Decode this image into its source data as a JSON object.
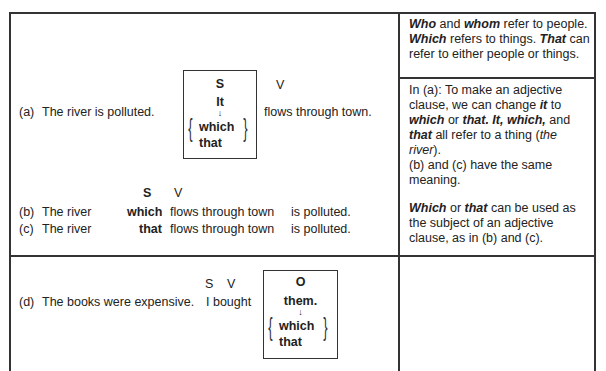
{
  "rows": [
    {
      "label": "(a)",
      "sentence": "The river is polluted.",
      "box": {
        "role": "S",
        "word": "It",
        "alt1": "which",
        "alt2": "that"
      },
      "verb_marker": "V",
      "rest": "flows through town."
    },
    {
      "markers": {
        "s": "S",
        "v": "V"
      },
      "b": {
        "label": "(b)",
        "head": "The river",
        "rel": "which",
        "clause": "flows through town",
        "end": "is polluted."
      },
      "c": {
        "label": "(c)",
        "head": "The river",
        "rel": "that",
        "clause": "flows through town",
        "end": "is polluted."
      }
    },
    {
      "label": "(d)",
      "sentence": "The books were expensive.",
      "markers": {
        "s": "S",
        "v": "V"
      },
      "subject_verb": "I bought",
      "box": {
        "role": "O",
        "word": "them.",
        "alt1": "which",
        "alt2": "that"
      }
    }
  ],
  "notes": {
    "n1": {
      "who": "Who",
      "and": " and ",
      "whom": "whom",
      "t1": " refer to people. ",
      "which": "Which",
      "t2": " refers to things. ",
      "that": "That",
      "t3": " can refer to either people or things."
    },
    "n2": {
      "t1": "In (a): To make an adjective clause, we can change ",
      "it": "it",
      "t2": " to ",
      "which": "which",
      "or": " or ",
      "that_it_which": "that. It, which,",
      "and": " and ",
      "that": "that",
      "t3": " all refer to a thing (",
      "the_river": "the river",
      "t4": ").",
      "t5": "(b) and (c) have the same meaning."
    },
    "n3": {
      "which": "Which",
      "or": " or ",
      "that": "that",
      "t1": " can be used as the subject of an adjective clause, as in (b) and (c)."
    }
  },
  "colors": {
    "ink": "#222222",
    "rule": "#333333",
    "paper": "#ffffff"
  }
}
